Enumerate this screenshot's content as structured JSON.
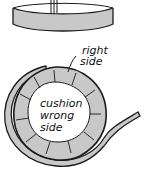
{
  "illustration": {
    "top_figure": "cushion-box-side-view",
    "bottom_figure": "welt-strip-around-cushion",
    "labels": {
      "right_side_line1": "right",
      "right_side_line2": "side",
      "center_line1": "cushion",
      "center_line2": "wrong",
      "center_line3": "side"
    },
    "colors": {
      "stroke": "#1a1a1a",
      "fill_gray": "#c8c8c8",
      "background": "#ffffff"
    }
  }
}
